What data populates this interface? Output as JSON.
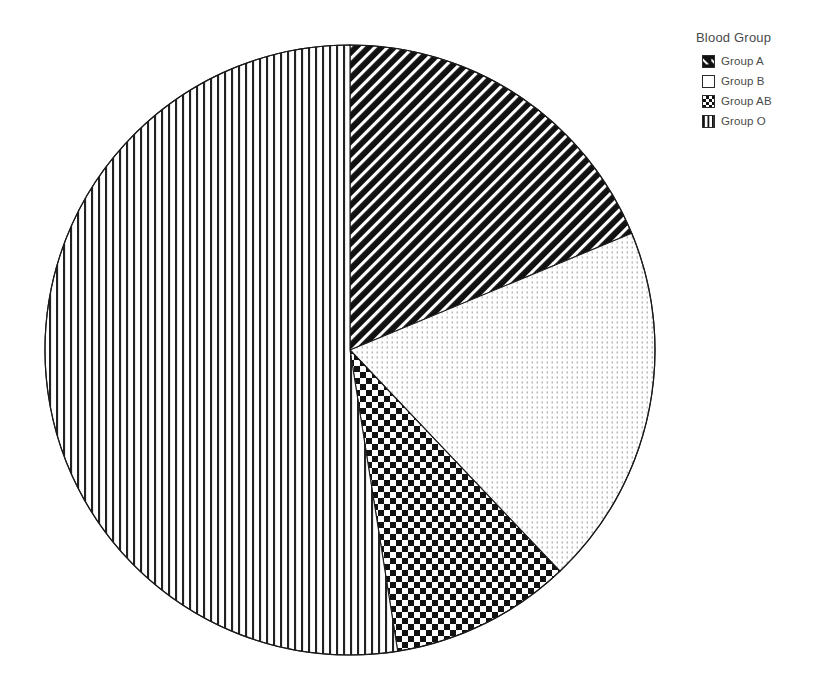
{
  "legend": {
    "title": "Blood Group",
    "items": [
      {
        "label": "Group A",
        "pattern": "diagonal-hatch",
        "swatch_class": "sw-diag"
      },
      {
        "label": "Group B",
        "pattern": "light-dots",
        "swatch_class": "sw-blank"
      },
      {
        "label": "Group AB",
        "pattern": "checkerboard",
        "swatch_class": "sw-check"
      },
      {
        "label": "Group O",
        "pattern": "vertical-lines",
        "swatch_class": "sw-vert"
      }
    ]
  },
  "chart_data": {
    "type": "pie",
    "title": "",
    "legend_title": "Blood Group",
    "legend_position": "right",
    "categories": [
      "Group A",
      "Group B",
      "Group AB",
      "Group O"
    ],
    "values": [
      18.8,
      19.2,
      9.6,
      52.4
    ],
    "unit": "percent",
    "start_angle_deg": 0,
    "direction": "clockwise",
    "slices": [
      {
        "label": "Group A",
        "value": 18.8,
        "start_deg": 0.0,
        "end_deg": 67.5,
        "fill": "diagonal-hatch"
      },
      {
        "label": "Group B",
        "value": 19.2,
        "start_deg": 67.5,
        "end_deg": 136.5,
        "fill": "light-dots"
      },
      {
        "label": "Group AB",
        "value": 9.6,
        "start_deg": 136.5,
        "end_deg": 171.0,
        "fill": "checkerboard"
      },
      {
        "label": "Group O",
        "value": 52.4,
        "start_deg": 171.0,
        "end_deg": 360.0,
        "fill": "vertical-lines"
      }
    ],
    "geometry": {
      "cx": 350,
      "cy": 350,
      "r": 305
    },
    "colors": {
      "stroke": "#1a1a1a",
      "pattern_dark": "#111111",
      "background": "#ffffff",
      "text": "#4a4a4a"
    }
  }
}
